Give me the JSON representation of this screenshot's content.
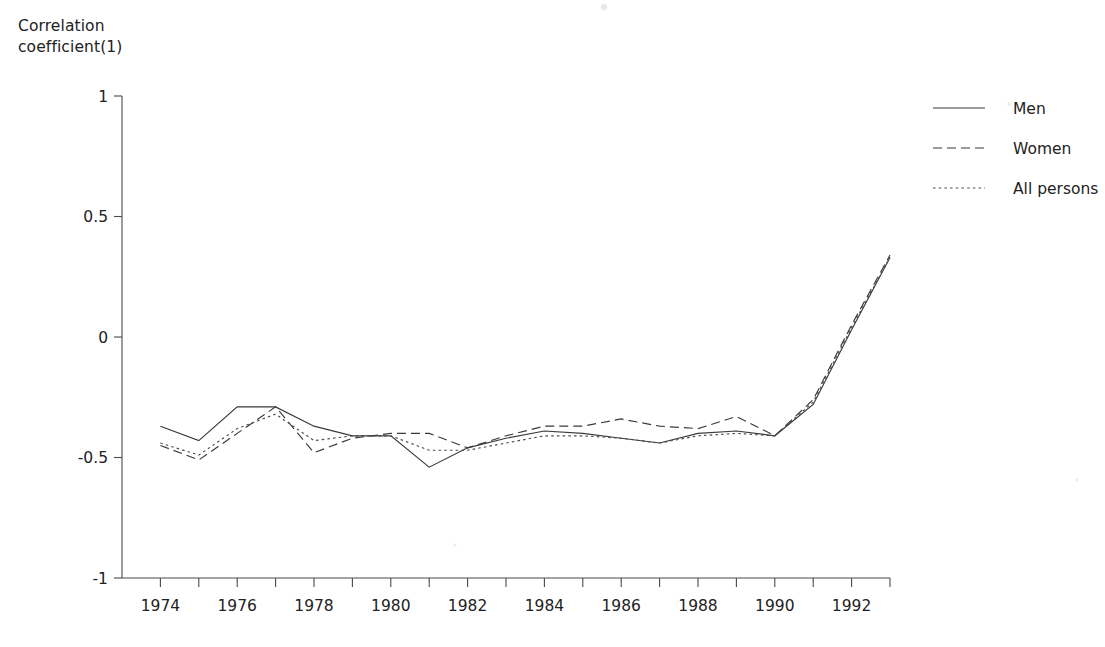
{
  "figure": {
    "y_axis_title": "Correlation\ncoefficient(1)"
  },
  "legend": {
    "position": "top-right",
    "items": [
      {
        "label": "Men",
        "style": "solid",
        "key": "men"
      },
      {
        "label": "Women",
        "style": "dashed",
        "key": "women"
      },
      {
        "label": "All persons",
        "style": "dotted",
        "key": "all_persons"
      }
    ]
  },
  "axes": {
    "y_ticks": [
      "1",
      "0.5",
      "0",
      "-0.5",
      "-1"
    ],
    "x_ticks": [
      "1974",
      "1976",
      "1978",
      "1980",
      "1982",
      "1984",
      "1986",
      "1988",
      "1990",
      "1992"
    ]
  },
  "chart_data": {
    "type": "line",
    "title": "",
    "subtitle": "",
    "xlabel": "",
    "ylabel": "Correlation coefficient(1)",
    "xlim": [
      1973,
      1993
    ],
    "ylim": [
      -1,
      1
    ],
    "grid": false,
    "legend_position": "top-right",
    "x": [
      1974,
      1975,
      1976,
      1977,
      1978,
      1979,
      1980,
      1981,
      1982,
      1983,
      1984,
      1985,
      1986,
      1987,
      1988,
      1989,
      1990,
      1991,
      1992,
      1993
    ],
    "series": [
      {
        "name": "Men",
        "style": "solid",
        "values": [
          -0.37,
          -0.43,
          -0.29,
          -0.29,
          -0.37,
          -0.41,
          -0.41,
          -0.54,
          -0.46,
          -0.42,
          -0.39,
          -0.4,
          -0.42,
          -0.44,
          -0.4,
          -0.39,
          -0.41,
          -0.28,
          0.03,
          0.33
        ]
      },
      {
        "name": "Women",
        "style": "dashed",
        "values": [
          -0.45,
          -0.51,
          -0.4,
          -0.29,
          -0.48,
          -0.42,
          -0.4,
          -0.4,
          -0.46,
          -0.41,
          -0.37,
          -0.37,
          -0.34,
          -0.37,
          -0.38,
          -0.33,
          -0.41,
          -0.26,
          0.05,
          0.34
        ]
      },
      {
        "name": "All persons",
        "style": "dotted",
        "values": [
          -0.44,
          -0.49,
          -0.38,
          -0.32,
          -0.43,
          -0.41,
          -0.41,
          -0.47,
          -0.47,
          -0.44,
          -0.41,
          -0.41,
          -0.42,
          -0.44,
          -0.41,
          -0.4,
          -0.41,
          -0.27,
          0.04,
          0.33
        ]
      }
    ]
  },
  "geometry": {
    "plot_left": 122,
    "plot_right": 890,
    "plot_top": 96,
    "plot_bottom": 578,
    "x_start": 1973,
    "x_end": 1993,
    "y_top_value": 1,
    "y_bottom_value": -1
  }
}
